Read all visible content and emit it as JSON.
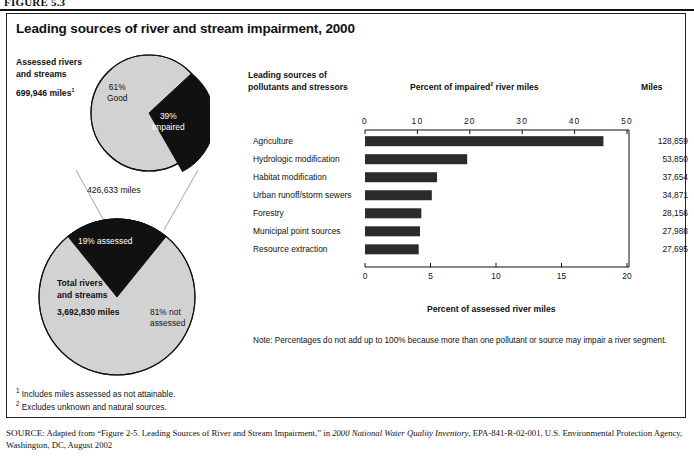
{
  "figure_label": "FIGURE 5.3",
  "title": "Leading sources of river and stream impairment, 2000",
  "left_panel": {
    "top_pie": {
      "heading_line1": "Assessed rivers",
      "heading_line2": "and streams",
      "total_label": "699,946 miles",
      "total_footnote_marker": "1",
      "slices": [
        {
          "label_line1": "61%",
          "label_line2": "Good",
          "value": 61,
          "color": "#d2d2d2"
        },
        {
          "label_line1": "39%",
          "label_line2": "Impaired",
          "value": 39,
          "color": "#111111"
        }
      ]
    },
    "connector_caption": "426,633 miles",
    "bottom_pie": {
      "heading_line1": "Total rivers",
      "heading_line2": "and streams",
      "total_label": "3,692,830 miles",
      "slices": [
        {
          "label": "19% assessed",
          "value": 19,
          "color": "#111111"
        },
        {
          "label_line1": "81% not",
          "label_line2": "assessed",
          "value": 81,
          "color": "#d2d2d2"
        }
      ]
    }
  },
  "chart_data": {
    "type": "bar",
    "orientation": "horizontal",
    "title": "Leading sources of river and stream impairment, 2000",
    "column_header_line1": "Leading sources of",
    "column_header_line2": "pollutants and stressors",
    "miles_header": "Miles",
    "top_axis_title_pre": "Percent of impaired",
    "top_axis_title_sup": "2",
    "top_axis_title_post": " river miles",
    "xlabel": "Percent of assessed river miles",
    "categories": [
      "Agriculture",
      "Hydrologic modification",
      "Habitat modification",
      "Urban runoff/storm sewers",
      "Forestry",
      "Municipal point sources",
      "Resource extraction"
    ],
    "values_percent_assessed": [
      18.2,
      7.8,
      5.5,
      5.1,
      4.3,
      4.2,
      4.1
    ],
    "values_percent_impaired": [
      46.6,
      19.9,
      14.0,
      13.0,
      11.0,
      10.8,
      10.5
    ],
    "miles": [
      "128,859",
      "53,850",
      "37,654",
      "34,871",
      "28,156",
      "27,988",
      "27,695"
    ],
    "top_axis_ticks": [
      "0",
      "10",
      "20",
      "30",
      "40",
      "50"
    ],
    "top_axis_range": [
      0,
      50
    ],
    "bottom_axis_ticks": [
      "0",
      "5",
      "10",
      "15",
      "20"
    ],
    "bottom_axis_range": [
      0,
      20
    ],
    "grid": false,
    "bar_color": "#2b2b2b",
    "note": "Note: Percentages do not add up to 100% because more than one pollutant or source may impair a river segment."
  },
  "footnotes": [
    {
      "marker": "1",
      "text": "Includes miles assessed as not attainable."
    },
    {
      "marker": "2",
      "text": "Excludes unknown and natural sources."
    }
  ],
  "source": {
    "prefix": "SOURCE:",
    "text_1": " Adapted from “Figure 2-5. Leading Sources of River and Stream Impairment,” in ",
    "italic_1": "2000 National Water Quality Inventory",
    "text_2": ", EPA-841-R-02-001, U.S. Environmental Protection Agency, Washington, DC, August 2002"
  }
}
